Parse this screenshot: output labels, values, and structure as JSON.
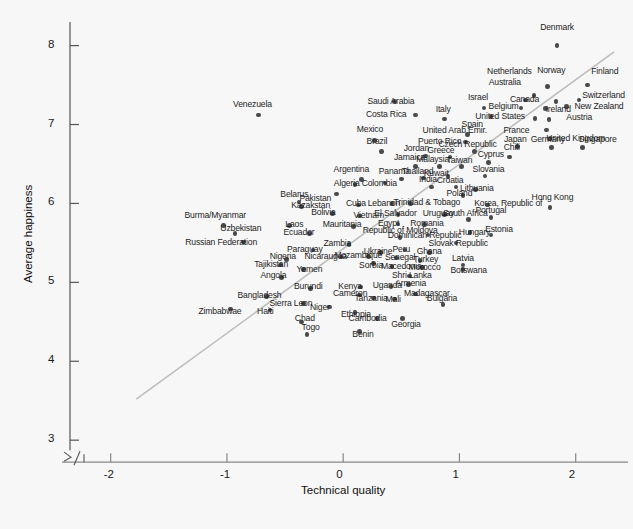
{
  "chart_data": {
    "type": "scatter",
    "title": "",
    "xlabel": "Technical quality",
    "ylabel": "Average happiness",
    "xlim": [
      -2.35,
      2.45
    ],
    "ylim": [
      2.85,
      8.35
    ],
    "xticks": [
      "-2",
      "-1",
      "0",
      "1",
      "2"
    ],
    "xtick_values": [
      -2,
      -1,
      0,
      1,
      2
    ],
    "yticks": [
      "3",
      "4",
      "5",
      "6",
      "7",
      "8"
    ],
    "ytick_values": [
      3,
      4,
      5,
      6,
      7,
      8
    ],
    "grid": false,
    "legend": null,
    "axis_break": "y-axis break between 3 and baseline",
    "point_color": "#4a4a4a",
    "trend_line": {
      "type": "linear-fit",
      "color": "#bdbdbd",
      "x0": -1.78,
      "y0": 3.52,
      "x1": 2.33,
      "y1": 7.92
    },
    "points": [
      {
        "label": "Denmark",
        "x": 1.84,
        "y": 8.0,
        "lx": 1.84,
        "ly": 8.22,
        "la": "c"
      },
      {
        "label": "Finland",
        "x": 2.1,
        "y": 7.5,
        "lx": 2.25,
        "ly": 7.67,
        "la": "c"
      },
      {
        "label": "Norway",
        "x": 1.76,
        "y": 7.48,
        "lx": 1.79,
        "ly": 7.68,
        "la": "c"
      },
      {
        "label": "Netherlands",
        "x": 1.64,
        "y": 7.37,
        "lx": 1.43,
        "ly": 7.66,
        "la": "c"
      },
      {
        "label": "Australia",
        "x": 1.57,
        "y": 7.31,
        "lx": 1.39,
        "ly": 7.52,
        "la": "c"
      },
      {
        "label": "Switzerland",
        "x": 2.03,
        "y": 7.31,
        "lx": 2.24,
        "ly": 7.36,
        "la": "c"
      },
      {
        "label": "Canada",
        "x": 1.83,
        "y": 7.29,
        "lx": 1.56,
        "ly": 7.31,
        "la": "c"
      },
      {
        "label": "New Zealand",
        "x": 1.92,
        "y": 7.23,
        "lx": 2.2,
        "ly": 7.22,
        "la": "c"
      },
      {
        "label": "Ireland",
        "x": 1.74,
        "y": 7.2,
        "lx": 1.85,
        "ly": 7.19,
        "la": "c"
      },
      {
        "label": "Belgium",
        "x": 1.53,
        "y": 7.21,
        "lx": 1.38,
        "ly": 7.22,
        "la": "c"
      },
      {
        "label": "Israel",
        "x": 1.21,
        "y": 7.21,
        "lx": 1.16,
        "ly": 7.33,
        "la": "c"
      },
      {
        "label": "Austria",
        "x": 1.77,
        "y": 7.06,
        "lx": 2.03,
        "ly": 7.08,
        "la": "c"
      },
      {
        "label": "United States",
        "x": 1.65,
        "y": 7.08,
        "lx": 1.35,
        "ly": 7.09,
        "la": "c"
      },
      {
        "label": "Spain",
        "x": 1.27,
        "y": 7.1,
        "lx": 1.11,
        "ly": 7.0,
        "la": "c"
      },
      {
        "label": "Italy",
        "x": 0.87,
        "y": 7.07,
        "lx": 0.86,
        "ly": 7.19,
        "la": "c"
      },
      {
        "label": "Costa Rica",
        "x": 0.62,
        "y": 7.12,
        "lx": 0.37,
        "ly": 7.12,
        "la": "c"
      },
      {
        "label": "Saudi Arabia",
        "x": 0.44,
        "y": 7.29,
        "lx": 0.41,
        "ly": 7.28,
        "la": "c"
      },
      {
        "label": "Venezuela",
        "x": -0.73,
        "y": 7.12,
        "lx": -0.78,
        "ly": 7.25,
        "la": "c"
      },
      {
        "label": "France",
        "x": 1.75,
        "y": 6.93,
        "lx": 1.49,
        "ly": 6.92,
        "la": "c"
      },
      {
        "label": "United Kingdom",
        "x": 1.78,
        "y": 6.82,
        "lx": 2.0,
        "ly": 6.82,
        "la": "c"
      },
      {
        "label": "United Arab Emir.",
        "x": 1.07,
        "y": 6.87,
        "lx": 0.96,
        "ly": 6.92,
        "la": "c"
      },
      {
        "label": "Mexico",
        "x": 0.27,
        "y": 6.8,
        "lx": 0.23,
        "ly": 6.93,
        "la": "c"
      },
      {
        "label": "Germany",
        "x": 1.79,
        "y": 6.71,
        "lx": 1.76,
        "ly": 6.8,
        "la": "c"
      },
      {
        "label": "Singapore",
        "x": 2.06,
        "y": 6.71,
        "lx": 2.19,
        "ly": 6.8,
        "la": "c"
      },
      {
        "label": "Japan",
        "x": 1.5,
        "y": 6.72,
        "lx": 1.48,
        "ly": 6.81,
        "la": "c"
      },
      {
        "label": "Czech Republic",
        "x": 1.13,
        "y": 6.66,
        "lx": 1.07,
        "ly": 6.74,
        "la": "c"
      },
      {
        "label": "Puerto Rico",
        "x": 1.05,
        "y": 6.78,
        "lx": 0.83,
        "ly": 6.78,
        "la": "c"
      },
      {
        "label": "Brazil",
        "x": 0.33,
        "y": 6.66,
        "lx": 0.29,
        "ly": 6.78,
        "la": "c"
      },
      {
        "label": "Chili",
        "x": 1.43,
        "y": 6.59,
        "lx": 1.45,
        "ly": 6.7,
        "la": "c"
      },
      {
        "label": "Greece",
        "x": 0.92,
        "y": 6.59,
        "lx": 0.84,
        "ly": 6.67,
        "la": "c"
      },
      {
        "label": "Jordan",
        "x": 0.71,
        "y": 6.6,
        "lx": 0.63,
        "ly": 6.69,
        "la": "c"
      },
      {
        "label": "Cyprus",
        "x": 1.25,
        "y": 6.52,
        "lx": 1.27,
        "ly": 6.61,
        "la": "c"
      },
      {
        "label": "Taiwan",
        "x": 1.02,
        "y": 6.47,
        "lx": 1.0,
        "ly": 6.54,
        "la": "c"
      },
      {
        "label": "Malaysia",
        "x": 0.83,
        "y": 6.47,
        "lx": 0.77,
        "ly": 6.55,
        "la": "c"
      },
      {
        "label": "Jamaica",
        "x": 0.62,
        "y": 6.47,
        "lx": 0.57,
        "ly": 6.57,
        "la": "c"
      },
      {
        "label": "Argentina",
        "x": 0.16,
        "y": 6.3,
        "lx": 0.07,
        "ly": 6.42,
        "la": "c"
      },
      {
        "label": "Slovania",
        "x": 1.22,
        "y": 6.35,
        "lx": 1.25,
        "ly": 6.43,
        "la": "c"
      },
      {
        "label": "Kuwait",
        "x": 0.9,
        "y": 6.34,
        "lx": 0.8,
        "ly": 6.37,
        "la": "c"
      },
      {
        "label": "Thailand",
        "x": 0.69,
        "y": 6.32,
        "lx": 0.64,
        "ly": 6.4,
        "la": "c"
      },
      {
        "label": "Panama",
        "x": 0.5,
        "y": 6.31,
        "lx": 0.44,
        "ly": 6.4,
        "la": "c"
      },
      {
        "label": "Pakistan",
        "x": -0.06,
        "y": 6.12,
        "lx": -0.24,
        "ly": 6.05,
        "la": "c"
      },
      {
        "label": "Croatia",
        "x": 0.97,
        "y": 6.21,
        "lx": 0.92,
        "ly": 6.29,
        "la": "c"
      },
      {
        "label": "India",
        "x": 0.76,
        "y": 6.21,
        "lx": 0.73,
        "ly": 6.3,
        "la": "c"
      },
      {
        "label": "Colombia",
        "x": 0.36,
        "y": 6.26,
        "lx": 0.31,
        "ly": 6.25,
        "la": "c"
      },
      {
        "label": "Algeria",
        "x": 0.1,
        "y": 6.24,
        "lx": 0.03,
        "ly": 6.24,
        "la": "c"
      },
      {
        "label": "Lithuania",
        "x": 1.14,
        "y": 6.18,
        "lx": 1.15,
        "ly": 6.18,
        "la": "c"
      },
      {
        "label": "Poland",
        "x": 1.03,
        "y": 6.1,
        "lx": 1.0,
        "ly": 6.12,
        "la": "c"
      },
      {
        "label": "Belarus",
        "x": -0.38,
        "y": 6.02,
        "lx": -0.42,
        "ly": 6.11,
        "la": "c"
      },
      {
        "label": "Kazakstan",
        "x": -0.36,
        "y": 5.96,
        "lx": -0.28,
        "ly": 5.97,
        "la": "c"
      },
      {
        "label": "Trinidad & Tobago",
        "x": 0.58,
        "y": 6.0,
        "lx": 0.72,
        "ly": 6.0,
        "la": "c"
      },
      {
        "label": "Lebanon",
        "x": 0.42,
        "y": 6.0,
        "lx": 0.35,
        "ly": 5.99,
        "la": "c"
      },
      {
        "label": "Cuba",
        "x": 0.13,
        "y": 5.98,
        "lx": 0.11,
        "ly": 5.99,
        "la": "c"
      },
      {
        "label": "Korea, Republic of",
        "x": 1.24,
        "y": 5.98,
        "lx": 1.42,
        "ly": 5.99,
        "la": "c"
      },
      {
        "label": "Hong Kong",
        "x": 1.78,
        "y": 5.95,
        "lx": 1.8,
        "ly": 6.07,
        "la": "c"
      },
      {
        "label": "Uruguay",
        "x": 0.87,
        "y": 5.86,
        "lx": 0.82,
        "ly": 5.87,
        "la": "c"
      },
      {
        "label": "South Africa",
        "x": 1.08,
        "y": 5.8,
        "lx": 1.05,
        "ly": 5.87,
        "la": "c"
      },
      {
        "label": "El Salvador",
        "x": 0.47,
        "y": 5.86,
        "lx": 0.45,
        "ly": 5.87,
        "la": "c"
      },
      {
        "label": "Portugal",
        "x": 1.27,
        "y": 5.82,
        "lx": 1.27,
        "ly": 5.9,
        "la": "c"
      },
      {
        "label": "Bolivia",
        "x": -0.09,
        "y": 5.87,
        "lx": -0.17,
        "ly": 5.88,
        "la": "c"
      },
      {
        "label": "Vietnam",
        "x": 0.14,
        "y": 5.84,
        "lx": 0.22,
        "ly": 5.84,
        "la": "c"
      },
      {
        "label": "Burma/Myanmar",
        "x": -1.03,
        "y": 5.72,
        "lx": -1.1,
        "ly": 5.84,
        "la": "c"
      },
      {
        "label": "Egypt",
        "x": 0.47,
        "y": 5.74,
        "lx": 0.39,
        "ly": 5.74,
        "la": "c"
      },
      {
        "label": "Romania",
        "x": 0.7,
        "y": 5.73,
        "lx": 0.72,
        "ly": 5.74,
        "la": "c"
      },
      {
        "label": "Mauritania",
        "x": 0.09,
        "y": 5.71,
        "lx": -0.01,
        "ly": 5.73,
        "la": "c"
      },
      {
        "label": "Laos",
        "x": -0.46,
        "y": 5.72,
        "lx": -0.42,
        "ly": 5.73,
        "la": "c"
      },
      {
        "label": "Uzbekistan",
        "x": -0.93,
        "y": 5.62,
        "lx": -0.88,
        "ly": 5.67,
        "la": "c"
      },
      {
        "label": "Ecuador",
        "x": -0.29,
        "y": 5.62,
        "lx": -0.38,
        "ly": 5.62,
        "la": "c"
      },
      {
        "label": "Estonia",
        "x": 1.27,
        "y": 5.6,
        "lx": 1.34,
        "ly": 5.66,
        "la": "c"
      },
      {
        "label": "Hungary",
        "x": 1.09,
        "y": 5.63,
        "lx": 1.13,
        "ly": 5.63,
        "la": "c"
      },
      {
        "label": "Republic of Moldova",
        "x": 0.49,
        "y": 5.57,
        "lx": 0.49,
        "ly": 5.65,
        "la": "c"
      },
      {
        "label": "Dominican Republic",
        "x": 0.73,
        "y": 5.6,
        "lx": 0.7,
        "ly": 5.59,
        "la": "c"
      },
      {
        "label": "Russian Federation",
        "x": -0.86,
        "y": 5.51,
        "lx": -1.05,
        "ly": 5.5,
        "la": "c"
      },
      {
        "label": "Zambia",
        "x": 0.05,
        "y": 5.48,
        "lx": -0.05,
        "ly": 5.48,
        "la": "c"
      },
      {
        "label": "Slovak Republic",
        "x": 0.97,
        "y": 5.5,
        "lx": 0.99,
        "ly": 5.49,
        "la": "c"
      },
      {
        "label": "Paraguay",
        "x": -0.26,
        "y": 5.41,
        "lx": -0.33,
        "ly": 5.41,
        "la": "c"
      },
      {
        "label": "Ukraine",
        "x": 0.32,
        "y": 5.38,
        "lx": 0.3,
        "ly": 5.38,
        "la": "c"
      },
      {
        "label": "Peru",
        "x": 0.53,
        "y": 5.41,
        "lx": 0.5,
        "ly": 5.41,
        "la": "c"
      },
      {
        "label": "Ghana",
        "x": 0.74,
        "y": 5.38,
        "lx": 0.74,
        "ly": 5.38,
        "la": "c"
      },
      {
        "label": "Mozambique",
        "x": 0.22,
        "y": 5.33,
        "lx": 0.13,
        "ly": 5.33,
        "la": "c"
      },
      {
        "label": "Nicaraugua",
        "x": -0.02,
        "y": 5.32,
        "lx": -0.15,
        "ly": 5.32,
        "la": "c"
      },
      {
        "label": "Nigeria",
        "x": -0.49,
        "y": 5.29,
        "lx": -0.52,
        "ly": 5.32,
        "la": "c"
      },
      {
        "label": "Senegal",
        "x": 0.46,
        "y": 5.31,
        "lx": 0.49,
        "ly": 5.31,
        "la": "c"
      },
      {
        "label": "Turkey",
        "x": 0.66,
        "y": 5.28,
        "lx": 0.71,
        "ly": 5.28,
        "la": "c"
      },
      {
        "label": "Latvia",
        "x": 1.03,
        "y": 5.22,
        "lx": 1.03,
        "ly": 5.3,
        "la": "c"
      },
      {
        "label": "Tajikistan",
        "x": -0.54,
        "y": 5.22,
        "lx": -0.62,
        "ly": 5.22,
        "la": "c"
      },
      {
        "label": "Sorbia",
        "x": 0.26,
        "y": 5.24,
        "lx": 0.24,
        "ly": 5.21,
        "la": "c"
      },
      {
        "label": "Macedonia",
        "x": 0.42,
        "y": 5.2,
        "lx": 0.5,
        "ly": 5.2,
        "la": "c"
      },
      {
        "label": "Morocco",
        "x": 0.68,
        "y": 5.19,
        "lx": 0.7,
        "ly": 5.18,
        "la": "c"
      },
      {
        "label": "Botswana",
        "x": 1.03,
        "y": 5.16,
        "lx": 1.08,
        "ly": 5.14,
        "la": "c"
      },
      {
        "label": "Yemen",
        "x": -0.34,
        "y": 5.16,
        "lx": -0.29,
        "ly": 5.16,
        "la": "c"
      },
      {
        "label": "Angola",
        "x": -0.53,
        "y": 5.06,
        "lx": -0.6,
        "ly": 5.08,
        "la": "c"
      },
      {
        "label": "Shri Lanka",
        "x": 0.57,
        "y": 5.08,
        "lx": 0.59,
        "ly": 5.08,
        "la": "c"
      },
      {
        "label": "Armenia",
        "x": 0.56,
        "y": 4.97,
        "lx": 0.58,
        "ly": 4.98,
        "la": "c"
      },
      {
        "label": "Uganda",
        "x": 0.41,
        "y": 4.95,
        "lx": 0.38,
        "ly": 4.95,
        "la": "c"
      },
      {
        "label": "Kenya",
        "x": 0.15,
        "y": 4.94,
        "lx": 0.06,
        "ly": 4.94,
        "la": "c"
      },
      {
        "label": "Burundi",
        "x": -0.28,
        "y": 4.92,
        "lx": -0.3,
        "ly": 4.94,
        "la": "c"
      },
      {
        "label": "Madagascar",
        "x": 0.62,
        "y": 4.85,
        "lx": 0.72,
        "ly": 4.85,
        "la": "c"
      },
      {
        "label": "Cameron",
        "x": 0.14,
        "y": 4.84,
        "lx": 0.06,
        "ly": 4.85,
        "la": "c"
      },
      {
        "label": "Bangladesh",
        "x": -0.66,
        "y": 4.82,
        "lx": -0.72,
        "ly": 4.83,
        "la": "c"
      },
      {
        "label": "Mali",
        "x": 0.44,
        "y": 4.79,
        "lx": 0.43,
        "ly": 4.78,
        "la": "c"
      },
      {
        "label": "Tanzania",
        "x": 0.26,
        "y": 4.8,
        "lx": 0.24,
        "ly": 4.79,
        "la": "c"
      },
      {
        "label": "Bulgaria",
        "x": 0.86,
        "y": 4.72,
        "lx": 0.85,
        "ly": 4.79,
        "la": "c"
      },
      {
        "label": "Sierra Leon",
        "x": -0.34,
        "y": 4.73,
        "lx": -0.45,
        "ly": 4.73,
        "la": "c"
      },
      {
        "label": "Niger",
        "x": -0.12,
        "y": 4.69,
        "lx": -0.2,
        "ly": 4.68,
        "la": "c"
      },
      {
        "label": "Haiti",
        "x": -0.63,
        "y": 4.65,
        "lx": -0.67,
        "ly": 4.62,
        "la": "c"
      },
      {
        "label": "Zimbabwae",
        "x": -0.97,
        "y": 4.66,
        "lx": -1.06,
        "ly": 4.62,
        "la": "c"
      },
      {
        "label": "Ethiopia",
        "x": 0.1,
        "y": 4.62,
        "lx": 0.11,
        "ly": 4.58,
        "la": "c"
      },
      {
        "label": "Cambodia",
        "x": 0.29,
        "y": 4.54,
        "lx": 0.21,
        "ly": 4.54,
        "la": "c"
      },
      {
        "label": "Chad",
        "x": -0.36,
        "y": 4.5,
        "lx": -0.33,
        "ly": 4.54,
        "la": "c"
      },
      {
        "label": "Georgia",
        "x": 0.51,
        "y": 4.54,
        "lx": 0.54,
        "ly": 4.46,
        "la": "c"
      },
      {
        "label": "Togo",
        "x": -0.31,
        "y": 4.34,
        "lx": -0.28,
        "ly": 4.42,
        "la": "c"
      },
      {
        "label": "Benin",
        "x": 0.14,
        "y": 4.38,
        "lx": 0.17,
        "ly": 4.33,
        "la": "c"
      }
    ]
  }
}
